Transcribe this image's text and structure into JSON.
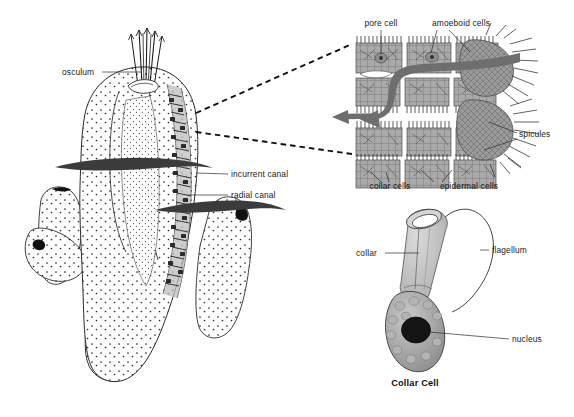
{
  "figure": {
    "background_color": "#ffffff",
    "ink_color": "#1a1a1a"
  },
  "sponge_panel": {
    "name": "branching-sponge-body",
    "labels": [
      {
        "id": "osculum",
        "text": "osculum",
        "x": 62,
        "y": 72
      },
      {
        "id": "incurrent_canal",
        "text": "incurrent canal",
        "x": 228,
        "y": 174
      },
      {
        "id": "radial_canal",
        "text": "radial canal",
        "x": 228,
        "y": 195
      }
    ],
    "flow_arrows": [
      {
        "id": "incurrent-flow-upper",
        "direction": "into-body"
      },
      {
        "id": "incurrent-flow-lower",
        "direction": "into-body"
      }
    ],
    "branch_count": 6,
    "osculum_openings": 4
  },
  "wall_detail_panel": {
    "name": "body-wall-cross-section",
    "labels": [
      {
        "id": "pore_cell",
        "text": "pore cell",
        "x": 381,
        "y": 23
      },
      {
        "id": "amoeboid_cells",
        "text": "amoeboid cells",
        "x": 448,
        "y": 23
      },
      {
        "id": "spicules",
        "text": "spicules",
        "x": 516,
        "y": 134
      },
      {
        "id": "collar_cells",
        "text": "collar cells",
        "x": 366,
        "y": 186
      },
      {
        "id": "epidermal_cells",
        "text": "epidermal cells",
        "x": 440,
        "y": 186
      }
    ],
    "water_flow_arrow": {
      "id": "water-current-arrow",
      "color": "#6e6e6e",
      "direction": "right-to-left"
    },
    "connector_lines": 2
  },
  "collar_cell_panel": {
    "name": "collar-cell-detail",
    "caption": "Collar Cell",
    "labels": [
      {
        "id": "collar",
        "text": "collar",
        "x": 356,
        "y": 253
      },
      {
        "id": "flagellum",
        "text": "flagellum",
        "x": 492,
        "y": 250
      },
      {
        "id": "nucleus",
        "text": "nucleus",
        "x": 512,
        "y": 339
      }
    ],
    "nucleus_color": "#141414",
    "cell_body_color": "#b9b9b9"
  }
}
